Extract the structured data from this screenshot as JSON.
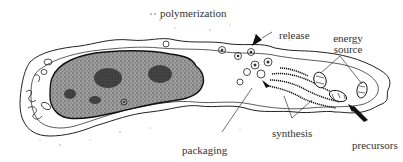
{
  "diagram": {
    "type": "secretory cell schematic",
    "labels": {
      "polymerization": "polymerization",
      "release": "release",
      "energy_source_line1": "energy",
      "energy_source_line2": "source",
      "packaging": "packaging",
      "synthesis": "synthesis",
      "precursors": "precursors"
    },
    "colors": {
      "ink": "#222222",
      "nucleus_fill": "#8a8a8a",
      "nucleus_dark": "#3a3a3a",
      "background": "#ffffff"
    }
  }
}
